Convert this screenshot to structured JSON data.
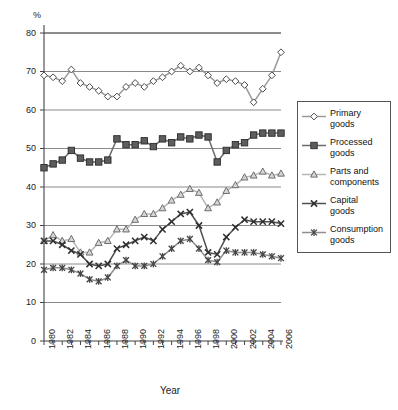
{
  "figure": {
    "unit_label": "%",
    "xlabel": "Year",
    "ylabel": ""
  },
  "legend": {
    "position": "right",
    "entries": [
      {
        "name": "Primary goods",
        "label_line1": "Primary",
        "label_line2": "goods",
        "marker": "diamond-open-marker",
        "color": "#9a9a9a",
        "marker_fill": "#ffffff",
        "marker_stroke": "#4a4a4a"
      },
      {
        "name": "Processed goods",
        "label_line1": "Processed",
        "label_line2": "goods",
        "marker": "square-filled-marker",
        "color": "#6b6b6b",
        "marker_fill": "#5d5d5d",
        "marker_stroke": "#2e2e2e"
      },
      {
        "name": "Parts and components",
        "label_line1": "Parts and",
        "label_line2": "components",
        "marker": "triangle-open-marker",
        "color": "#b5b5b5",
        "marker_fill": "#d8d8d8",
        "marker_stroke": "#707070"
      },
      {
        "name": "Capital goods",
        "label_line1": "Capital",
        "label_line2": "goods",
        "marker": "cross-x-marker",
        "color": "#4f4f4f",
        "marker_fill": "#333333",
        "marker_stroke": "#333333"
      },
      {
        "name": "Consumption goods",
        "label_line1": "Consumption",
        "label_line2": "goods",
        "marker": "asterisk-marker",
        "color": "#8e8e8e",
        "marker_fill": "#4a4a4a",
        "marker_stroke": "#4a4a4a"
      }
    ]
  },
  "chart_data": {
    "type": "line",
    "title": "",
    "xlabel": "Year",
    "ylabel": "%",
    "grid": true,
    "legend_position": "right",
    "xlim": [
      1980,
      2006
    ],
    "ylim": [
      0,
      80
    ],
    "ytick_values": [
      0,
      10,
      20,
      30,
      40,
      50,
      60,
      70,
      80
    ],
    "ytick_labels": [
      "0",
      "10",
      "20",
      "30",
      "40",
      "50",
      "60",
      "70",
      "80"
    ],
    "x": [
      1980,
      1981,
      1982,
      1983,
      1984,
      1985,
      1986,
      1987,
      1988,
      1989,
      1990,
      1991,
      1992,
      1993,
      1994,
      1995,
      1996,
      1997,
      1998,
      1999,
      2000,
      2001,
      2002,
      2003,
      2004,
      2005,
      2006
    ],
    "xtick_values": [
      1980,
      1982,
      1984,
      1986,
      1988,
      1990,
      1992,
      1994,
      1996,
      1998,
      2000,
      2002,
      2004,
      2006
    ],
    "xtick_labels": [
      "1980",
      "1982",
      "1984",
      "1986",
      "1988",
      "1990",
      "1992",
      "1994",
      "1996",
      "1998",
      "2000",
      "2002",
      "2004",
      "2006"
    ],
    "series": [
      {
        "name": "Primary goods",
        "marker": "diamond-open-marker",
        "color": "#9a9a9a",
        "values": [
          69.0,
          68.5,
          67.5,
          70.5,
          67.0,
          66.0,
          65.0,
          63.5,
          63.5,
          66.0,
          67.0,
          66.0,
          67.5,
          68.5,
          70.0,
          71.5,
          70.0,
          71.0,
          69.0,
          67.0,
          68.0,
          67.5,
          66.5,
          62.0,
          65.5,
          69.0,
          75.0
        ]
      },
      {
        "name": "Processed goods",
        "marker": "square-filled-marker",
        "color": "#6b6b6b",
        "values": [
          45.0,
          46.0,
          47.0,
          49.5,
          47.5,
          46.5,
          46.5,
          47.0,
          52.5,
          51.0,
          51.0,
          52.0,
          50.5,
          52.5,
          51.5,
          53.0,
          52.5,
          53.5,
          53.0,
          46.5,
          49.5,
          51.0,
          51.5,
          53.5,
          54.0,
          54.0,
          54.0
        ]
      },
      {
        "name": "Parts and components",
        "marker": "triangle-open-marker",
        "color": "#b5b5b5",
        "values": [
          26.0,
          27.5,
          26.0,
          26.5,
          23.0,
          23.0,
          25.5,
          26.0,
          29.0,
          29.0,
          31.5,
          33.0,
          33.0,
          34.5,
          36.5,
          38.0,
          39.5,
          38.5,
          34.5,
          36.0,
          39.0,
          40.5,
          42.5,
          43.0,
          44.0,
          43.0,
          43.5
        ]
      },
      {
        "name": "Capital goods",
        "marker": "cross-x-marker",
        "color": "#4f4f4f",
        "values": [
          26.0,
          26.0,
          25.0,
          23.5,
          22.5,
          20.0,
          19.5,
          20.0,
          24.0,
          25.0,
          26.0,
          27.0,
          26.0,
          29.0,
          31.0,
          33.0,
          33.5,
          30.0,
          23.0,
          22.5,
          27.0,
          29.5,
          31.5,
          31.0,
          31.0,
          31.0,
          30.5
        ]
      },
      {
        "name": "Consumption goods",
        "marker": "asterisk-marker",
        "color": "#8e8e8e",
        "values": [
          18.5,
          19.0,
          19.0,
          18.5,
          17.5,
          16.0,
          15.5,
          16.5,
          19.5,
          21.0,
          19.5,
          19.5,
          20.0,
          22.0,
          24.0,
          26.0,
          26.5,
          24.0,
          21.0,
          20.5,
          23.5,
          23.0,
          23.0,
          23.0,
          22.5,
          22.0,
          21.5
        ]
      }
    ]
  }
}
